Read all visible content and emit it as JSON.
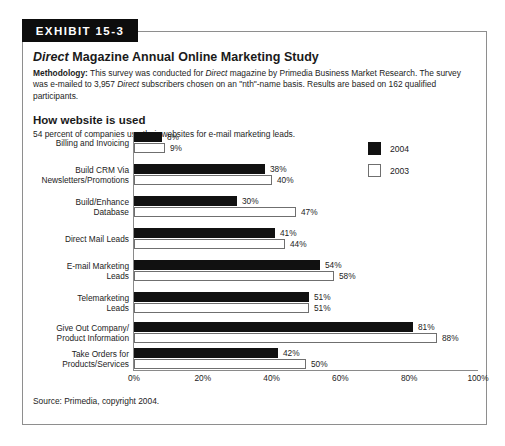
{
  "exhibit": {
    "banner_label": "EXHIBIT 15-3",
    "title_italic": "Direct",
    "title_rest": " Magazine Annual Online Marketing Study",
    "methodology_label": "Methodology:",
    "methodology_part1": " This survey was conducted for ",
    "methodology_italic1": "Direct",
    "methodology_part2": " magazine by Primedia Business Market Research. The survey was e-mailed to 3,957 ",
    "methodology_italic2": "Direct",
    "methodology_part3": " subscribers chosen on an \"nth\"-name basis. Results are based on 162 qualified participants.",
    "section_title": "How website is used",
    "section_subtitle": "54 percent of companies use their websites for e-mail marketing leads.",
    "source": "Source: Primedia, copyright 2004."
  },
  "chart_data": {
    "type": "bar",
    "orientation": "horizontal",
    "title": "How website is used",
    "xlabel": "",
    "ylabel": "",
    "xlim": [
      0,
      100
    ],
    "grid": false,
    "legend_position": "top-right",
    "value_suffix": "%",
    "categories": [
      "Billing and Invoicing",
      "Build CRM Via Newsletters/Promotions",
      "Build/Enhance Database",
      "Direct Mail Leads",
      "E-mail Marketing Leads",
      "Telemarketing Leads",
      "Give Out Company/ Product Information",
      "Take Orders for Products/Services"
    ],
    "category_lines": [
      [
        "Billing and Invoicing"
      ],
      [
        "Build CRM Via",
        "Newsletters/Promotions"
      ],
      [
        "Build/Enhance",
        "Database"
      ],
      [
        "Direct Mail Leads"
      ],
      [
        "E-mail Marketing",
        "Leads"
      ],
      [
        "Telemarketing",
        "Leads"
      ],
      [
        "Give Out Company/",
        "Product Information"
      ],
      [
        "Take Orders for",
        "Products/Services"
      ]
    ],
    "series": [
      {
        "name": "2004",
        "color": "#111111",
        "values": [
          8,
          38,
          30,
          41,
          54,
          51,
          81,
          42
        ],
        "labels": [
          "8%",
          "38%",
          "30%",
          "41%",
          "54%",
          "51%",
          "81%",
          "42%"
        ]
      },
      {
        "name": "2003",
        "color": "#ffffff",
        "values": [
          9,
          40,
          47,
          44,
          58,
          51,
          88,
          50
        ],
        "labels": [
          "9%",
          "40%",
          "47%",
          "44%",
          "58%",
          "51%",
          "88%",
          "50%"
        ]
      }
    ],
    "xticks": [
      0,
      20,
      40,
      60,
      80,
      100
    ],
    "xtick_labels": [
      "0%",
      "20%",
      "40%",
      "60%",
      "80%",
      "100%"
    ]
  },
  "legend": {
    "items": [
      {
        "label": "2004",
        "style": "filled"
      },
      {
        "label": "2003",
        "style": "hollow"
      }
    ]
  }
}
